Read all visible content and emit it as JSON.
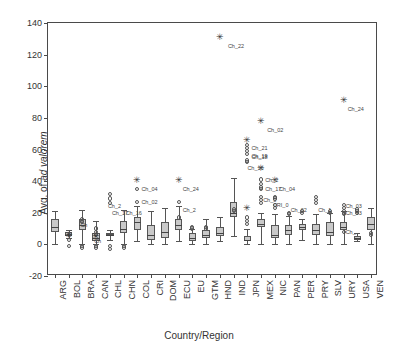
{
  "chart_data": {
    "type": "box",
    "title": "",
    "xlabel": "Country/Region",
    "ylabel": "Avg. of ad valorem",
    "ylabel_plain": "Avg. of ",
    "ylabel_italic": "ad valorem",
    "ylim": [
      -20,
      140
    ],
    "yticks": [
      -20,
      0,
      20,
      40,
      60,
      80,
      100,
      120,
      140
    ],
    "grid": false,
    "legend": "none",
    "categories": [
      "ARG",
      "BOL",
      "BRA",
      "CAN",
      "CHL",
      "CHN",
      "COL",
      "CRI",
      "DOM",
      "ECU",
      "EU",
      "GTM",
      "HND",
      "IND",
      "JPN",
      "MEX",
      "NIC",
      "PAN",
      "PER",
      "PRY",
      "SLV",
      "URY",
      "USA",
      "VEN"
    ],
    "boxes": [
      {
        "cat": "ARG",
        "low": 0,
        "q1": 8,
        "median": 11,
        "q3": 16,
        "high": 21
      },
      {
        "cat": "BOL",
        "low": 4,
        "q1": 5,
        "median": 6,
        "q3": 8,
        "high": 9
      },
      {
        "cat": "BRA",
        "low": 0,
        "q1": 9,
        "median": 12,
        "q3": 16,
        "high": 22
      },
      {
        "cat": "CAN",
        "low": 0,
        "q1": 2,
        "median": 4,
        "q3": 7,
        "high": 15
      },
      {
        "cat": "CHL",
        "low": 3,
        "q1": 6,
        "median": 6,
        "q3": 7,
        "high": 9
      },
      {
        "cat": "CHN",
        "low": 0,
        "q1": 7,
        "median": 10,
        "q3": 15,
        "high": 22
      },
      {
        "cat": "COL",
        "low": 2,
        "q1": 9,
        "median": 14,
        "q3": 17,
        "high": 24
      },
      {
        "cat": "CRI",
        "low": 0,
        "q1": 3,
        "median": 6,
        "q3": 12,
        "high": 21
      },
      {
        "cat": "DOM",
        "low": 0,
        "q1": 4,
        "median": 8,
        "q3": 14,
        "high": 23
      },
      {
        "cat": "ECU",
        "low": 2,
        "q1": 9,
        "median": 12,
        "q3": 16,
        "high": 24
      },
      {
        "cat": "EU",
        "low": 0,
        "q1": 2,
        "median": 4,
        "q3": 7,
        "high": 10
      },
      {
        "cat": "GTM",
        "low": 0,
        "q1": 4,
        "median": 6,
        "q3": 9,
        "high": 16
      },
      {
        "cat": "HND",
        "low": 2,
        "q1": 5,
        "median": 7,
        "q3": 11,
        "high": 17
      },
      {
        "cat": "IND",
        "low": 5,
        "q1": 17,
        "median": 20,
        "q3": 27,
        "high": 42
      },
      {
        "cat": "JPN",
        "low": 0,
        "q1": 2,
        "median": 3,
        "q3": 5,
        "high": 10
      },
      {
        "cat": "MEX",
        "low": 0,
        "q1": 11,
        "median": 13,
        "q3": 16,
        "high": 20
      },
      {
        "cat": "NIC",
        "low": 0,
        "q1": 4,
        "median": 6,
        "q3": 12,
        "high": 19
      },
      {
        "cat": "PAN",
        "low": 0,
        "q1": 6,
        "median": 9,
        "q3": 12,
        "high": 18
      },
      {
        "cat": "PER",
        "low": 3,
        "q1": 9,
        "median": 11,
        "q3": 13,
        "high": 16
      },
      {
        "cat": "PRY",
        "low": 0,
        "q1": 6,
        "median": 9,
        "q3": 13,
        "high": 19
      },
      {
        "cat": "SLV",
        "low": 0,
        "q1": 5,
        "median": 8,
        "q3": 14,
        "high": 20
      },
      {
        "cat": "URY",
        "low": 0,
        "q1": 9,
        "median": 11,
        "q3": 14,
        "high": 21
      },
      {
        "cat": "USA",
        "low": 2,
        "q1": 3,
        "median": 4,
        "q3": 5,
        "high": 7
      },
      {
        "cat": "VEN",
        "low": 0,
        "q1": 9,
        "median": 13,
        "q3": 17,
        "high": 23
      }
    ],
    "outliers": [
      {
        "cat": "BOL",
        "value": 6
      },
      {
        "cat": "BOL",
        "value": 3
      },
      {
        "cat": "BOL",
        "value": -1
      },
      {
        "cat": "BRA",
        "value": 16
      },
      {
        "cat": "BRA",
        "value": 15
      },
      {
        "cat": "BRA",
        "value": 14
      },
      {
        "cat": "BRA",
        "value": -1
      },
      {
        "cat": "BRA",
        "value": -2
      },
      {
        "cat": "CAN",
        "value": 10
      },
      {
        "cat": "CAN",
        "value": 8
      },
      {
        "cat": "CAN",
        "value": 6
      },
      {
        "cat": "CAN",
        "value": -1
      },
      {
        "cat": "CAN",
        "value": -2
      },
      {
        "cat": "CHL",
        "value": 32
      },
      {
        "cat": "CHL",
        "value": 29
      },
      {
        "cat": "CHL",
        "value": 26
      },
      {
        "cat": "CHL",
        "value": -1
      },
      {
        "cat": "CHL",
        "value": -3
      },
      {
        "cat": "CHN",
        "value": -1
      },
      {
        "cat": "CHN",
        "value": -2
      },
      {
        "cat": "COL",
        "value": 35
      },
      {
        "cat": "COL",
        "value": 27
      },
      {
        "cat": "ECU",
        "value": 27
      },
      {
        "cat": "ECU",
        "value": 17
      },
      {
        "cat": "EU",
        "value": 11
      },
      {
        "cat": "EU",
        "value": 10
      },
      {
        "cat": "GTM",
        "value": 11
      },
      {
        "cat": "GTM",
        "value": 10
      },
      {
        "cat": "IND",
        "value": 22
      },
      {
        "cat": "IND",
        "value": 21
      },
      {
        "cat": "JPN",
        "value": 63
      },
      {
        "cat": "JPN",
        "value": 61
      },
      {
        "cat": "JPN",
        "value": 59
      },
      {
        "cat": "JPN",
        "value": 57
      },
      {
        "cat": "JPN",
        "value": 53
      },
      {
        "cat": "JPN",
        "value": 52
      },
      {
        "cat": "JPN",
        "value": 17
      },
      {
        "cat": "JPN",
        "value": 15
      },
      {
        "cat": "JPN",
        "value": 13
      },
      {
        "cat": "MEX",
        "value": 41
      },
      {
        "cat": "MEX",
        "value": 38
      },
      {
        "cat": "MEX",
        "value": 36
      },
      {
        "cat": "MEX",
        "value": 35
      },
      {
        "cat": "MEX",
        "value": 30
      },
      {
        "cat": "MEX",
        "value": 28
      },
      {
        "cat": "MEX",
        "value": 26
      },
      {
        "cat": "NIC",
        "value": 30
      },
      {
        "cat": "NIC",
        "value": 29
      },
      {
        "cat": "NIC",
        "value": 25
      },
      {
        "cat": "NIC",
        "value": 23
      },
      {
        "cat": "PAN",
        "value": 20
      },
      {
        "cat": "PAN",
        "value": 19
      },
      {
        "cat": "PER",
        "value": 21
      },
      {
        "cat": "PER",
        "value": 20
      },
      {
        "cat": "PRY",
        "value": 30
      },
      {
        "cat": "PRY",
        "value": 28
      },
      {
        "cat": "PRY",
        "value": 26
      },
      {
        "cat": "SLV",
        "value": 21
      },
      {
        "cat": "SLV",
        "value": 20
      },
      {
        "cat": "URY",
        "value": 25
      },
      {
        "cat": "URY",
        "value": 23
      },
      {
        "cat": "URY",
        "value": 21
      },
      {
        "cat": "URY",
        "value": 20
      },
      {
        "cat": "URY",
        "value": 19
      },
      {
        "cat": "URY",
        "value": 8
      },
      {
        "cat": "USA",
        "value": 22
      },
      {
        "cat": "USA",
        "value": 21
      },
      {
        "cat": "USA",
        "value": 20
      },
      {
        "cat": "VEN",
        "value": 7
      },
      {
        "cat": "VEN",
        "value": 6
      }
    ],
    "extremes": [
      {
        "cat": "COL",
        "value": 41,
        "label": "Ch_04"
      },
      {
        "cat": "ECU",
        "value": 41,
        "label": "Ch_24"
      },
      {
        "cat": "HND",
        "value": 131,
        "label": "Ch_22"
      },
      {
        "cat": "JPN",
        "value": 66,
        "label": "Ch_21"
      },
      {
        "cat": "JPN",
        "value": 23,
        "label": ""
      },
      {
        "cat": "MEX",
        "value": 78,
        "label": "Ch_02"
      },
      {
        "cat": "MEX",
        "value": 48,
        "label": ""
      },
      {
        "cat": "NIC",
        "value": 41,
        "label": "Ch_04"
      },
      {
        "cat": "CAN",
        "value": 5,
        "label": ""
      },
      {
        "cat": "BOL",
        "value": 6,
        "label": ""
      },
      {
        "cat": "URY",
        "value": 91,
        "label": "Ch_24"
      }
    ],
    "point_labels": [
      {
        "cat": "HND",
        "value": 131,
        "text": "Ch_22",
        "dx": 8,
        "dy": 9
      },
      {
        "cat": "COL",
        "value": 35,
        "text": "Ch_04",
        "dx": 4,
        "dy": 0
      },
      {
        "cat": "COL",
        "value": 27,
        "text": "Ch_02",
        "dx": 4,
        "dy": 0
      },
      {
        "cat": "CHL",
        "value": 24,
        "text": "Ch_2",
        "dx": -2,
        "dy": 0
      },
      {
        "cat": "CHL",
        "value": 20,
        "text": "Ch_17",
        "dx": 2,
        "dy": 0
      },
      {
        "cat": "CHN",
        "value": 20,
        "text": "Ch_16",
        "dx": 2,
        "dy": 0
      },
      {
        "cat": "ECU",
        "value": 35,
        "text": "Ch_24",
        "dx": 4,
        "dy": 0
      },
      {
        "cat": "ECU",
        "value": 22,
        "text": "Ch_2",
        "dx": 4,
        "dy": 0
      },
      {
        "cat": "JPN",
        "value": 61,
        "text": "Ch_21",
        "dx": 4,
        "dy": 0
      },
      {
        "cat": "JPN",
        "value": 56,
        "text": "Ch_19",
        "dx": 4,
        "dy": 0
      },
      {
        "cat": "JPN",
        "value": 55,
        "text": "Ch_18",
        "dx": 4,
        "dy": 0
      },
      {
        "cat": "JPN",
        "value": 48,
        "text": "Ch_16",
        "dx": 0,
        "dy": 0
      },
      {
        "cat": "MEX",
        "value": 78,
        "text": "Ch_02",
        "dx": 6,
        "dy": 9
      },
      {
        "cat": "MEX",
        "value": 41,
        "text": "Ch_2",
        "dx": 4,
        "dy": 0
      },
      {
        "cat": "MEX",
        "value": 35,
        "text": "Ch_17",
        "dx": 4,
        "dy": 0
      },
      {
        "cat": "NIC",
        "value": 35,
        "text": "Ch_04",
        "dx": 4,
        "dy": 0
      },
      {
        "cat": "MEX",
        "value": 28,
        "text": "Ch_0",
        "dx": 2,
        "dy": 0
      },
      {
        "cat": "NIC",
        "value": 25,
        "text": "CRI_0",
        "dx": -2,
        "dy": 0
      },
      {
        "cat": "PAN",
        "value": 22,
        "text": "Ch_02",
        "dx": 2,
        "dy": 0
      },
      {
        "cat": "PRY",
        "value": 22,
        "text": "Ch_1",
        "dx": 2,
        "dy": 0
      },
      {
        "cat": "URY",
        "value": 24,
        "text": "Ch_03",
        "dx": 2,
        "dy": 0
      },
      {
        "cat": "URY",
        "value": 20,
        "text": "Ch_93",
        "dx": 2,
        "dy": 0
      },
      {
        "cat": "URY",
        "value": 8,
        "text": "Ch_",
        "dx": 2,
        "dy": 0
      },
      {
        "cat": "URY",
        "value": 91,
        "text": "Ch_24",
        "dx": 4,
        "dy": 9
      },
      {
        "cat": "COL",
        "value": 41,
        "text": "",
        "dx": 0,
        "dy": 0
      },
      {
        "cat": "BRA",
        "value": 12,
        "text": "Ch",
        "dx": -2,
        "dy": 0
      },
      {
        "cat": "CAN",
        "value": 2,
        "text": "Ch",
        "dx": -2,
        "dy": 0
      }
    ]
  }
}
